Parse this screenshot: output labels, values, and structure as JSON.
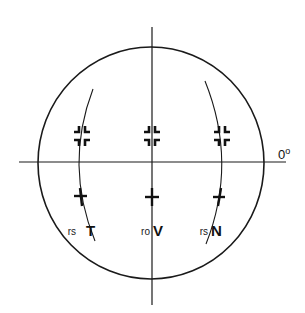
{
  "diagram": {
    "type": "perimetry-field-chart",
    "colors": {
      "line": "#1a1a1a",
      "background": "#ffffff"
    },
    "axis_label": {
      "text": "0",
      "superscript": "o"
    },
    "markers_upper": [
      {
        "name": "upper-left",
        "symbol": "broken-cross"
      },
      {
        "name": "upper-center",
        "symbol": "broken-cross"
      },
      {
        "name": "upper-right",
        "symbol": "broken-cross"
      }
    ],
    "markers_lower": [
      {
        "name": "lower-left",
        "symbol": "plus"
      },
      {
        "name": "lower-center",
        "symbol": "plus"
      },
      {
        "name": "lower-right",
        "symbol": "plus"
      }
    ],
    "labels": [
      {
        "prefix": "rs",
        "letter": "T"
      },
      {
        "prefix": "ro",
        "letter": "V"
      },
      {
        "prefix": "rs",
        "letter": "N"
      }
    ]
  }
}
